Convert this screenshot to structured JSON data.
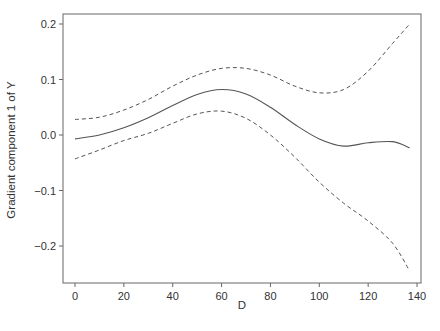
{
  "chart_data": {
    "type": "line",
    "title": "",
    "xlabel": "D",
    "ylabel": "Gradient component 1 of Y",
    "xlim": [
      -5,
      141
    ],
    "ylim": [
      -0.268,
      0.217
    ],
    "xticks": [
      0,
      20,
      40,
      60,
      80,
      100,
      120,
      140
    ],
    "xtick_labels": [
      "0",
      "20",
      "40",
      "60",
      "80",
      "100",
      "120",
      "140"
    ],
    "yticks": [
      0.2,
      0.1,
      0.0,
      -0.1,
      -0.2
    ],
    "ytick_labels": [
      "0.2",
      "0.1",
      "0.0",
      "−0.1",
      "−0.2"
    ],
    "grid": false,
    "legend": null,
    "x": [
      0,
      10,
      20,
      30,
      40,
      50,
      60,
      70,
      80,
      90,
      100,
      110,
      120,
      130,
      137
    ],
    "series": [
      {
        "name": "estimate",
        "style": "solid",
        "values": [
          -0.007,
          0.0,
          0.013,
          0.031,
          0.053,
          0.073,
          0.082,
          0.074,
          0.05,
          0.019,
          -0.007,
          -0.02,
          -0.014,
          -0.012,
          -0.023
        ]
      },
      {
        "name": "upper band",
        "style": "dashed",
        "values": [
          0.028,
          0.032,
          0.045,
          0.064,
          0.088,
          0.108,
          0.12,
          0.12,
          0.108,
          0.088,
          0.076,
          0.082,
          0.115,
          0.165,
          0.2
        ]
      },
      {
        "name": "lower band",
        "style": "dashed",
        "values": [
          -0.043,
          -0.027,
          -0.01,
          0.003,
          0.021,
          0.038,
          0.043,
          0.03,
          0.0,
          -0.04,
          -0.085,
          -0.123,
          -0.155,
          -0.195,
          -0.245
        ]
      }
    ]
  },
  "layout": {
    "frame": {
      "left": 63,
      "top": 14,
      "right": 421,
      "bottom": 283
    },
    "x_origin_px": 75,
    "x_px_per_unit": 2.443,
    "y_zero_px": 135,
    "y_px_per_unit": 555,
    "line_color": "#555555",
    "axis_color": "#666666"
  }
}
